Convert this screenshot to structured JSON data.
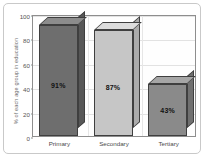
{
  "chart_data": {
    "type": "bar",
    "title": "",
    "subtitle": "",
    "xlabel": "",
    "ylabel": "% of each age group in education",
    "categories": [
      "Primary",
      "Secondary",
      "Tertiary"
    ],
    "values": [
      91,
      87,
      43
    ],
    "data_labels": [
      "91%",
      "87%",
      "43%"
    ],
    "ylim": [
      0,
      100
    ],
    "yticks": [
      0,
      20,
      40,
      60,
      80,
      100
    ],
    "ytick_labels": [
      "0",
      "20",
      "40",
      "60",
      "80",
      "100"
    ],
    "grid": true,
    "legend": false,
    "legend_position": "none",
    "series": [
      {
        "name": "% of each age group in education",
        "values": [
          91,
          87,
          43
        ],
        "colors": [
          "#6e6e6e",
          "#c6c6c6",
          "#8a8a8a"
        ]
      }
    ],
    "style": {
      "bar_face_colors": [
        "#6e6e6e",
        "#c6c6c6",
        "#8a8a8a"
      ],
      "bar_top_colors": [
        "#8c8c8c",
        "#dcdcdc",
        "#a6a6a6"
      ],
      "bar_side_colors": [
        "#575757",
        "#ababab",
        "#707070"
      ],
      "bar_edge_color": "#3f3f3f",
      "grid_color": "#e2e2e2",
      "axis_color": "#8e8e8e",
      "frame_color": "#c9c9c9",
      "plot_background": "#fefefe",
      "page_background": "#ffffff",
      "three_d": true
    }
  }
}
